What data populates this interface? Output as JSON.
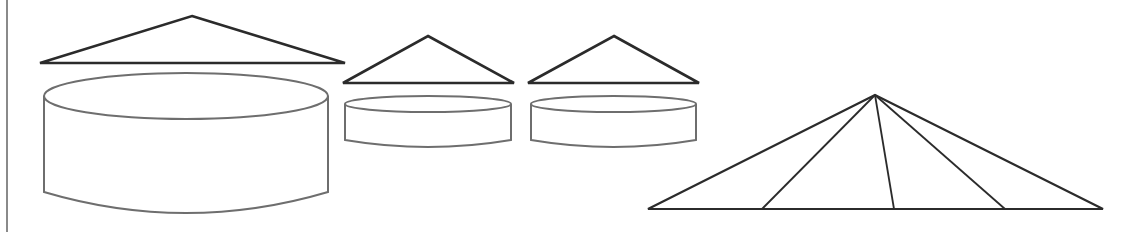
{
  "figure": {
    "width": 1139,
    "height": 232,
    "background": "#ffffff",
    "stroke_dark": "#2b2b2b",
    "stroke_gray": "#6e6e6e",
    "left_border": {
      "x": 7,
      "y1": 0,
      "y2": 232,
      "color": "#8a8a8a"
    },
    "shapes": [
      {
        "id": "large-triangle",
        "type": "triangle",
        "apex": [
          192,
          16
        ],
        "base_left": [
          40,
          63
        ],
        "base_right": [
          345,
          63
        ]
      },
      {
        "id": "large-cylinder",
        "type": "cylinder",
        "cx": 186,
        "x_left": 44,
        "x_right": 328,
        "top_cy": 96,
        "ry": 23,
        "side_bottom_y": 192,
        "bottom_arc_y": 213
      },
      {
        "id": "small-triangle-1",
        "type": "triangle",
        "apex": [
          428,
          36
        ],
        "base_left": [
          343,
          83
        ],
        "base_right": [
          514,
          83
        ]
      },
      {
        "id": "small-cylinder-1",
        "type": "cylinder",
        "cx": 428,
        "x_left": 345,
        "x_right": 511,
        "top_cy": 104,
        "ry": 8,
        "side_bottom_y": 140,
        "bottom_arc_y": 147
      },
      {
        "id": "small-triangle-2",
        "type": "triangle",
        "apex": [
          614,
          36
        ],
        "base_left": [
          528,
          83
        ],
        "base_right": [
          699,
          83
        ]
      },
      {
        "id": "small-cylinder-2",
        "type": "cylinder",
        "cx": 613,
        "x_left": 531,
        "x_right": 696,
        "top_cy": 104,
        "ry": 8,
        "side_bottom_y": 140,
        "bottom_arc_y": 147
      },
      {
        "id": "divided-triangle",
        "type": "fan-triangle",
        "apex": [
          875,
          95
        ],
        "base_y": 209,
        "base_left_x": 648,
        "base_right_x": 1103,
        "inner_line_base_x": [
          762,
          894,
          1005
        ]
      }
    ]
  }
}
